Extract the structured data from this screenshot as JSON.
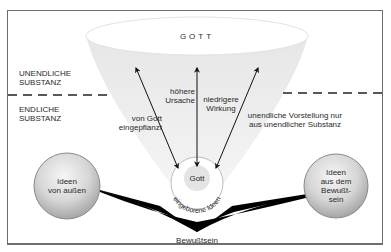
{
  "diagram": {
    "top_label": "GOTT",
    "zones": {
      "upper": "UNENDLICHE\nSUBSTANZ",
      "upper_line1": "UNENDLICHE",
      "upper_line2": "SUBSTANZ",
      "lower_line1": "ENDLICHE",
      "lower_line2": "SUBSTANZ"
    },
    "arrows": [
      {
        "name": "left-arrow",
        "label_line1": "von Gott",
        "label_line2": "eingepflanzt"
      },
      {
        "name": "center-arrow",
        "label_left_line1": "höhere",
        "label_left_line2": "Ursache",
        "label_right_line1": "niedrigere",
        "label_right_line2": "Wirkung"
      },
      {
        "name": "right-arrow",
        "label_line1": "unendliche Vorstellung nur",
        "label_line2": "aus unendlicher Substanz"
      }
    ],
    "center_circle": {
      "inner_label": "Gott",
      "ring_label": "eingeborene Ideen"
    },
    "left_circle": {
      "line1": "Ideen",
      "line2": "von außen"
    },
    "right_circle": {
      "line1": "Ideen",
      "line2": "aus dem",
      "line3": "Bewußt-",
      "line4": "sein"
    },
    "bottom_label": "Bewußtsein",
    "colors": {
      "frame": "#6e6e6e",
      "funnel": "#ececec",
      "ellipse": "#ffffff",
      "circle_fill_light": "#f2f2f2",
      "circle_fill_dark": "#a8a8a8",
      "wedge": "#000000",
      "dash": "#222222"
    }
  }
}
